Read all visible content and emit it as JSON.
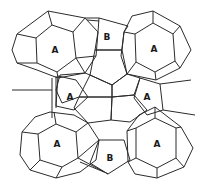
{
  "diagram": {
    "type": "polyhedral-cage-packing",
    "labels": {
      "a_top_left": "A",
      "b_top": "B",
      "a_top_right": "A",
      "a_mid_left": "A",
      "a_mid_right": "A",
      "a_bottom_left": "A",
      "b_bottom": "B",
      "a_bottom_right": "A"
    },
    "colors": {
      "line": "#2b2b2b",
      "background": "#ffffff",
      "label": "#1a1a1a"
    }
  }
}
